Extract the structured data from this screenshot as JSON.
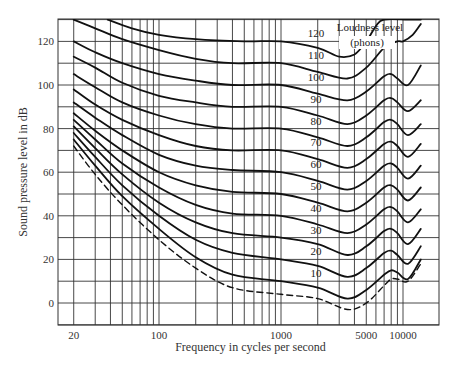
{
  "chart_data": {
    "type": "line",
    "title": "",
    "xlabel": "Frequency in cycles per second",
    "ylabel": "Sound pressure level in dB",
    "xscale": "log",
    "xlim": [
      15,
      16000
    ],
    "ylim": [
      -10,
      130
    ],
    "x_tick_labels": [
      "20",
      "100",
      "1000",
      "5000",
      "10000"
    ],
    "x_ticks": [
      20,
      100,
      1000,
      5000,
      10000
    ],
    "y_tick_labels": [
      "0",
      "20",
      "40",
      "60",
      "80",
      "100",
      "120"
    ],
    "y_ticks": [
      0,
      20,
      40,
      60,
      80,
      100,
      120
    ],
    "grid": true,
    "x_gridlines": [
      20,
      30,
      40,
      50,
      60,
      70,
      80,
      90,
      100,
      200,
      300,
      400,
      500,
      600,
      700,
      800,
      900,
      1000,
      2000,
      3000,
      4000,
      5000,
      6000,
      7000,
      8000,
      9000,
      10000
    ],
    "y_gridlines": [
      -10,
      0,
      10,
      20,
      30,
      40,
      50,
      60,
      70,
      80,
      90,
      100,
      110,
      120,
      130
    ],
    "legend_annotation": "Loudness level (phons)",
    "series": [
      {
        "name": "120",
        "label": "120",
        "style": "solid",
        "points": [
          [
            38,
            130
          ],
          [
            60,
            126
          ],
          [
            100,
            123
          ],
          [
            200,
            121
          ],
          [
            500,
            120
          ],
          [
            1000,
            120
          ],
          [
            2000,
            117
          ],
          [
            3000,
            113
          ],
          [
            4000,
            114
          ],
          [
            5000,
            120
          ],
          [
            6000,
            127
          ],
          [
            7000,
            130
          ],
          [
            11000,
            130
          ],
          [
            14000,
            130
          ]
        ]
      },
      {
        "name": "110",
        "label": "110",
        "style": "solid",
        "points": [
          [
            20,
            130
          ],
          [
            30,
            126
          ],
          [
            50,
            121
          ],
          [
            100,
            116
          ],
          [
            200,
            112
          ],
          [
            400,
            110
          ],
          [
            1000,
            110
          ],
          [
            2000,
            106
          ],
          [
            3500,
            103
          ],
          [
            5000,
            108
          ],
          [
            7000,
            117
          ],
          [
            9000,
            120
          ],
          [
            10000,
            120
          ],
          [
            12000,
            123
          ],
          [
            14000,
            128
          ]
        ]
      },
      {
        "name": "100",
        "label": "100",
        "style": "solid",
        "points": [
          [
            20,
            120
          ],
          [
            30,
            115
          ],
          [
            50,
            110
          ],
          [
            100,
            105
          ],
          [
            200,
            102
          ],
          [
            400,
            100
          ],
          [
            1000,
            100
          ],
          [
            2000,
            96
          ],
          [
            3500,
            93
          ],
          [
            5000,
            97
          ],
          [
            7000,
            104
          ],
          [
            8000,
            105
          ],
          [
            9000,
            103
          ],
          [
            11000,
            100
          ],
          [
            14000,
            109
          ]
        ]
      },
      {
        "name": "90",
        "label": "90",
        "style": "solid",
        "points": [
          [
            20,
            113
          ],
          [
            30,
            108
          ],
          [
            50,
            101
          ],
          [
            100,
            95
          ],
          [
            200,
            92
          ],
          [
            400,
            90
          ],
          [
            1000,
            90
          ],
          [
            2000,
            86
          ],
          [
            3500,
            82
          ],
          [
            5000,
            86
          ],
          [
            7000,
            93
          ],
          [
            8000,
            94
          ],
          [
            9000,
            92
          ],
          [
            11000,
            88
          ],
          [
            14000,
            93
          ]
        ]
      },
      {
        "name": "80",
        "label": "80",
        "style": "solid",
        "points": [
          [
            20,
            105
          ],
          [
            30,
            99
          ],
          [
            50,
            92
          ],
          [
            100,
            86
          ],
          [
            200,
            82
          ],
          [
            400,
            80
          ],
          [
            1000,
            80
          ],
          [
            2000,
            76
          ],
          [
            3500,
            72
          ],
          [
            5000,
            76
          ],
          [
            7000,
            83
          ],
          [
            8000,
            84
          ],
          [
            9000,
            82
          ],
          [
            11000,
            77
          ],
          [
            14000,
            82
          ]
        ]
      },
      {
        "name": "70",
        "label": "70",
        "style": "solid",
        "points": [
          [
            20,
            98
          ],
          [
            30,
            91
          ],
          [
            50,
            84
          ],
          [
            100,
            77
          ],
          [
            200,
            72
          ],
          [
            400,
            70
          ],
          [
            1000,
            70
          ],
          [
            2000,
            66
          ],
          [
            3500,
            62
          ],
          [
            5000,
            66
          ],
          [
            7000,
            73
          ],
          [
            8000,
            74
          ],
          [
            9000,
            72
          ],
          [
            11000,
            67
          ],
          [
            14000,
            73
          ]
        ]
      },
      {
        "name": "60",
        "label": "60",
        "style": "solid",
        "points": [
          [
            20,
            92
          ],
          [
            30,
            85
          ],
          [
            50,
            77
          ],
          [
            100,
            68
          ],
          [
            200,
            63
          ],
          [
            400,
            61
          ],
          [
            1000,
            60
          ],
          [
            2000,
            56
          ],
          [
            3500,
            52
          ],
          [
            5000,
            56
          ],
          [
            7000,
            63
          ],
          [
            8000,
            64
          ],
          [
            9000,
            62
          ],
          [
            11000,
            57
          ],
          [
            14000,
            63
          ]
        ]
      },
      {
        "name": "50",
        "label": "50",
        "style": "solid",
        "points": [
          [
            20,
            87
          ],
          [
            30,
            79
          ],
          [
            50,
            70
          ],
          [
            100,
            60
          ],
          [
            200,
            54
          ],
          [
            400,
            51
          ],
          [
            1000,
            50
          ],
          [
            2000,
            46
          ],
          [
            3500,
            42
          ],
          [
            5000,
            46
          ],
          [
            7000,
            53
          ],
          [
            8000,
            54
          ],
          [
            9000,
            52
          ],
          [
            11000,
            47
          ],
          [
            14000,
            53
          ]
        ]
      },
      {
        "name": "40",
        "label": "40",
        "style": "solid",
        "points": [
          [
            20,
            84
          ],
          [
            30,
            75
          ],
          [
            50,
            64
          ],
          [
            100,
            53
          ],
          [
            200,
            45
          ],
          [
            400,
            41
          ],
          [
            1000,
            40
          ],
          [
            2000,
            36
          ],
          [
            3500,
            32
          ],
          [
            5000,
            36
          ],
          [
            7000,
            43
          ],
          [
            8000,
            44
          ],
          [
            9000,
            42
          ],
          [
            11000,
            37
          ],
          [
            14000,
            43
          ]
        ]
      },
      {
        "name": "30",
        "label": "30",
        "style": "solid",
        "points": [
          [
            20,
            81
          ],
          [
            30,
            71
          ],
          [
            50,
            59
          ],
          [
            100,
            46
          ],
          [
            200,
            37
          ],
          [
            400,
            32
          ],
          [
            1000,
            30
          ],
          [
            2000,
            27
          ],
          [
            3500,
            22
          ],
          [
            5000,
            26
          ],
          [
            7000,
            33
          ],
          [
            8000,
            34
          ],
          [
            9000,
            32
          ],
          [
            11000,
            27
          ],
          [
            14000,
            34
          ]
        ]
      },
      {
        "name": "20",
        "label": "20",
        "style": "solid",
        "points": [
          [
            20,
            78
          ],
          [
            30,
            67
          ],
          [
            50,
            54
          ],
          [
            100,
            40
          ],
          [
            200,
            29
          ],
          [
            400,
            23
          ],
          [
            1000,
            20
          ],
          [
            2000,
            17
          ],
          [
            3500,
            12
          ],
          [
            5000,
            16
          ],
          [
            7000,
            23
          ],
          [
            8000,
            24
          ],
          [
            9000,
            22
          ],
          [
            11000,
            18
          ],
          [
            14000,
            26
          ]
        ]
      },
      {
        "name": "10",
        "label": "10",
        "style": "solid",
        "points": [
          [
            20,
            75
          ],
          [
            30,
            63
          ],
          [
            50,
            49
          ],
          [
            100,
            34
          ],
          [
            200,
            21
          ],
          [
            400,
            13
          ],
          [
            1000,
            10
          ],
          [
            2000,
            7
          ],
          [
            3500,
            2
          ],
          [
            5000,
            6
          ],
          [
            7000,
            13
          ],
          [
            8000,
            15
          ],
          [
            9000,
            14
          ],
          [
            11000,
            11
          ],
          [
            14000,
            20
          ]
        ]
      },
      {
        "name": "threshold",
        "label": "",
        "style": "dashed",
        "points": [
          [
            20,
            72
          ],
          [
            30,
            59
          ],
          [
            50,
            45
          ],
          [
            100,
            29
          ],
          [
            200,
            16
          ],
          [
            400,
            7
          ],
          [
            1000,
            4
          ],
          [
            2000,
            2
          ],
          [
            3500,
            -3
          ],
          [
            5000,
            0
          ],
          [
            7000,
            8
          ],
          [
            8000,
            11
          ],
          [
            9000,
            11
          ],
          [
            11000,
            10
          ],
          [
            14000,
            18
          ]
        ]
      }
    ],
    "phon_label_positions": {
      "x_hz": 2000,
      "dy_above": 6
    }
  }
}
